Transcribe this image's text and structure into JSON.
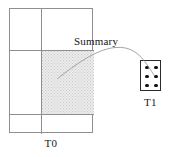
{
  "figure": {
    "type": "diagram",
    "background_color": "#ffffff"
  },
  "source_table": {
    "name": "T0",
    "label": "T0",
    "columns": 2,
    "rows": 3,
    "border_color": "#8f8f8f",
    "highlighted_cell": {
      "column_index": 1,
      "row_index": 1,
      "fill_color": "#ececec",
      "pattern": "stipple-dots",
      "pattern_dot_color": "#c9c9c9"
    }
  },
  "summary_arrow": {
    "label": "Summary",
    "stroke_color": "#9a9a9a",
    "from": "highlighted cell of T0",
    "to": "T1 dot box"
  },
  "target_box": {
    "name": "T1",
    "label": "T1",
    "border_color": "#2b2b2b",
    "dot_color": "#111111",
    "dot_columns": 2,
    "dot_rows": 3,
    "dot_count": 6,
    "dots": [
      {
        "id": "dot-r1c1",
        "cx": 6,
        "cy": 6.5
      },
      {
        "id": "dot-r1c2",
        "cx": 15,
        "cy": 6.5
      },
      {
        "id": "dot-r2c1",
        "cx": 6,
        "cy": 15.5
      },
      {
        "id": "dot-r2c2",
        "cx": 15,
        "cy": 15.5
      },
      {
        "id": "dot-r3c1",
        "cx": 6,
        "cy": 24.5
      },
      {
        "id": "dot-r3c2",
        "cx": 15,
        "cy": 24.5
      }
    ]
  }
}
